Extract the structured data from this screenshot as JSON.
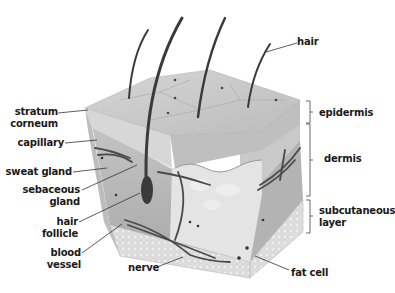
{
  "diagram": {
    "labels_left": [
      {
        "id": "stratum-corneum",
        "line1": "stratum",
        "line2": "corneum"
      },
      {
        "id": "capillary",
        "line1": "capillary"
      },
      {
        "id": "sweat-gland",
        "line1": "sweat gland"
      },
      {
        "id": "sebaceous-gland",
        "line1": "sebaceous",
        "line2": "gland"
      },
      {
        "id": "hair-follicle",
        "line1": "hair",
        "line2": "follicle"
      },
      {
        "id": "blood-vessel",
        "line1": "blood",
        "line2": "vessel"
      }
    ],
    "labels_right": [
      {
        "id": "hair",
        "line1": "hair"
      },
      {
        "id": "epidermis",
        "line1": "epidermis"
      },
      {
        "id": "dermis",
        "line1": "dermis"
      },
      {
        "id": "subcutaneous-layer",
        "line1": "subcutaneous",
        "line2": "layer"
      },
      {
        "id": "fat-cell",
        "line1": "fat cell"
      }
    ],
    "labels_bottom": [
      {
        "id": "nerve",
        "line1": "nerve"
      }
    ],
    "colors": {
      "epidermis_top": "#c9c9c9",
      "epidermis_side": "#d8d8d8",
      "dermis": "#bdbdbd",
      "subcutaneous": "#dcdcdc",
      "hair": "#3a3a3a",
      "vessel": "#4a4a4a",
      "label_text": "#1a1a1a",
      "leader_line": "#333333"
    }
  }
}
